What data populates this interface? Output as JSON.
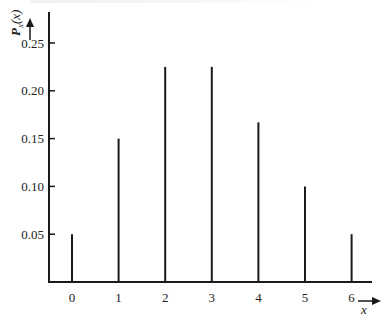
{
  "chart_data": {
    "type": "bar",
    "subtype": "stem",
    "title": "",
    "xlabel": "x",
    "ylabel": "P_x(x)",
    "categories": [
      "0",
      "1",
      "2",
      "3",
      "4",
      "5",
      "6"
    ],
    "x": [
      0,
      1,
      2,
      3,
      4,
      5,
      6
    ],
    "values": [
      0.05,
      0.15,
      0.225,
      0.225,
      0.167,
      0.1,
      0.05
    ],
    "yticks": [
      "0.05",
      "0.10",
      "0.15",
      "0.20",
      "0.25"
    ],
    "ytick_values": [
      0.05,
      0.1,
      0.15,
      0.2,
      0.25
    ],
    "xticks": [
      "0",
      "1",
      "2",
      "3",
      "4",
      "5",
      "6"
    ],
    "ylim": [
      0,
      0.28
    ],
    "xlim": [
      -0.5,
      6.7
    ],
    "grid": false,
    "legend": null
  },
  "axes": {
    "y_label_main": "P",
    "y_label_sub": "x",
    "y_label_arg": "(x)",
    "x_label": "x"
  },
  "colors": {
    "ink": "#1a1a1a",
    "background": "#ffffff"
  }
}
